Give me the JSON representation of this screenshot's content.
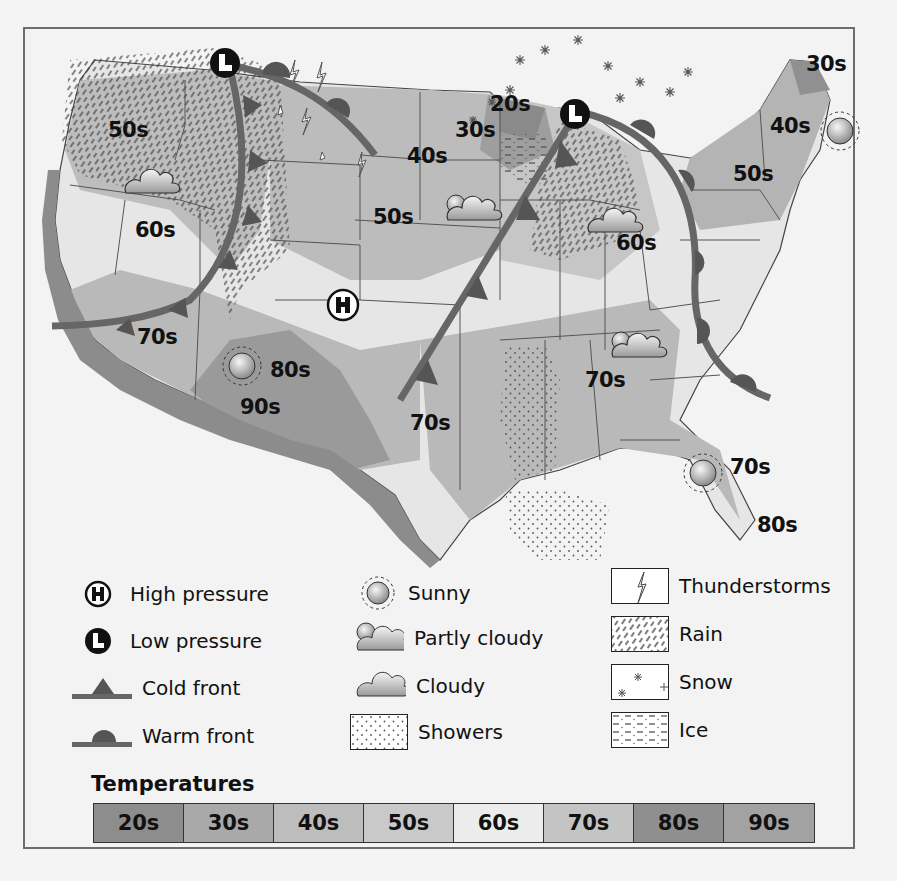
{
  "map": {
    "title": "U.S. Weather Map",
    "temperature_labels": [
      {
        "text": "50s",
        "x": 108,
        "y": 130
      },
      {
        "text": "60s",
        "x": 135,
        "y": 230
      },
      {
        "text": "70s",
        "x": 137,
        "y": 337
      },
      {
        "text": "80s",
        "x": 270,
        "y": 370
      },
      {
        "text": "90s",
        "x": 240,
        "y": 407
      },
      {
        "text": "40s",
        "x": 407,
        "y": 156
      },
      {
        "text": "50s",
        "x": 373,
        "y": 217
      },
      {
        "text": "30s",
        "x": 455,
        "y": 130
      },
      {
        "text": "20s",
        "x": 490,
        "y": 104
      },
      {
        "text": "70s",
        "x": 410,
        "y": 423
      },
      {
        "text": "60s",
        "x": 616,
        "y": 243
      },
      {
        "text": "70s",
        "x": 585,
        "y": 380
      },
      {
        "text": "30s",
        "x": 806,
        "y": 64
      },
      {
        "text": "40s",
        "x": 770,
        "y": 126
      },
      {
        "text": "50s",
        "x": 733,
        "y": 174
      },
      {
        "text": "70s",
        "x": 730,
        "y": 467
      },
      {
        "text": "80s",
        "x": 757,
        "y": 525
      }
    ],
    "pressure_markers": [
      {
        "type": "low",
        "letter": "L",
        "x": 225,
        "y": 63
      },
      {
        "type": "low",
        "letter": "L",
        "x": 575,
        "y": 114
      },
      {
        "type": "high",
        "letter": "H",
        "x": 343,
        "y": 305
      }
    ],
    "weather_icons": [
      {
        "type": "cloudy",
        "x": 152,
        "y": 183
      },
      {
        "type": "partly-cloudy",
        "x": 470,
        "y": 208
      },
      {
        "type": "cloudy",
        "x": 615,
        "y": 222
      },
      {
        "type": "sunny",
        "x": 242,
        "y": 366
      },
      {
        "type": "partly-cloudy",
        "x": 635,
        "y": 345
      },
      {
        "type": "sunny",
        "x": 840,
        "y": 131
      },
      {
        "type": "sunny",
        "x": 703,
        "y": 473
      }
    ]
  },
  "legend": {
    "col1": [
      {
        "icon": "high-pressure",
        "label": "High pressure"
      },
      {
        "icon": "low-pressure",
        "label": "Low pressure"
      },
      {
        "icon": "cold-front",
        "label": "Cold front"
      },
      {
        "icon": "warm-front",
        "label": "Warm front"
      }
    ],
    "col2": [
      {
        "icon": "sunny",
        "label": "Sunny"
      },
      {
        "icon": "partly-cloudy",
        "label": "Partly cloudy"
      },
      {
        "icon": "cloudy",
        "label": "Cloudy"
      },
      {
        "icon": "showers",
        "label": "Showers"
      }
    ],
    "col3": [
      {
        "icon": "thunderstorms",
        "label": "Thunderstorms"
      },
      {
        "icon": "rain",
        "label": "Rain"
      },
      {
        "icon": "snow",
        "label": "Snow"
      },
      {
        "icon": "ice",
        "label": "Ice"
      }
    ],
    "symbols": {
      "high": "H",
      "low": "L"
    }
  },
  "temperatures": {
    "title": "Temperatures",
    "bands": [
      {
        "label": "20s",
        "color": "#8d8d8d"
      },
      {
        "label": "30s",
        "color": "#a9a9a9"
      },
      {
        "label": "40s",
        "color": "#bdbdbd"
      },
      {
        "label": "50s",
        "color": "#c9c9c9"
      },
      {
        "label": "60s",
        "color": "#ececec"
      },
      {
        "label": "70s",
        "color": "#c4c4c4"
      },
      {
        "label": "80s",
        "color": "#8f8f8f"
      },
      {
        "label": "90s",
        "color": "#a2a2a2"
      }
    ]
  }
}
